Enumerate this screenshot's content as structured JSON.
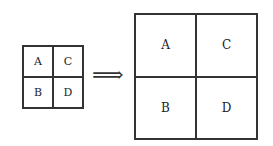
{
  "diagram": {
    "small_grid": {
      "cells": [
        "A",
        "C",
        "B",
        "D"
      ]
    },
    "arrow": "⟹",
    "large_grid": {
      "cells": [
        "A",
        "C",
        "B",
        "D"
      ]
    }
  }
}
